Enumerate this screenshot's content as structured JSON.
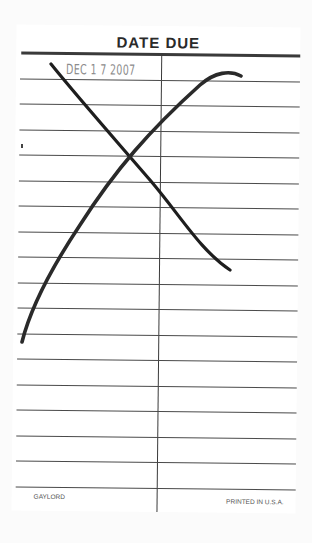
{
  "card": {
    "title": "DATE DUE",
    "stamped_date": "DEC 1 7 2007",
    "footer_left": "GAYLORD",
    "footer_right": "PRINTED IN U.S.A.",
    "row_count": 18,
    "columns": 2
  },
  "marks": {
    "cross_out": "X drawn in black marker over date column",
    "stroke_color": "#1e1e1e"
  }
}
